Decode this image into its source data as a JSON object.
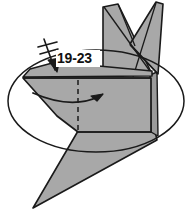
{
  "figure": {
    "kind": "origami-folding-diagram",
    "background_color": "#ffffff",
    "paper_fill_color": "#a8a8a8",
    "paper_shade_color": "#9b9b9b",
    "line_color": "#1a1a1a",
    "label_box_color": "#ffffff"
  },
  "annotations": {
    "step_reference_label": "19-23",
    "step_reference_title": "repeat steps 19 through 23",
    "zoom_circle_name": "zoom-ellipse",
    "fold_arrow_name": "curved-fold-arrow",
    "repeat_arrow_name": "repeat-arrow-with-tick",
    "crease_line_name": "dashed-valley-crease"
  },
  "shapes": {
    "ear_left_name": "left-ear-flap",
    "ear_right_name": "right-ear-flap",
    "body_name": "body-panel",
    "tail_name": "tail-wedge",
    "front_flap_name": "front-thin-flap"
  },
  "geometry": {
    "ellipse": {
      "cx": 96,
      "cy": 101,
      "rx": 88,
      "ry": 51
    },
    "label_text_pos": {
      "x": 57,
      "y": 63
    },
    "canvas": {
      "width": 191,
      "height": 211
    }
  }
}
